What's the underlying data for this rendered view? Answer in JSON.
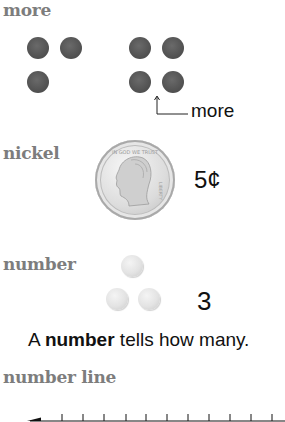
{
  "sections": {
    "more": {
      "term": "more",
      "label": "more",
      "left_group_count": 3,
      "right_group_count": 4,
      "dot_color": "#555555"
    },
    "nickel": {
      "term": "nickel",
      "value": "5¢",
      "coin_icon": "nickel-coin"
    },
    "number": {
      "term": "number",
      "count_value": "3",
      "definition_prefix": "A ",
      "definition_bold": "number",
      "definition_suffix": " tells how many.",
      "dot_color": "#e3e3e3"
    },
    "number_line": {
      "term": "number line",
      "tick_count": 11
    }
  },
  "colors": {
    "term_heading": "#7d7d7d",
    "body_text": "#111111"
  }
}
